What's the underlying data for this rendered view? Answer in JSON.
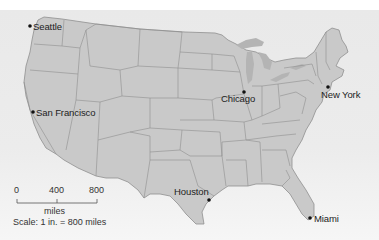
{
  "map": {
    "title": "United States",
    "land_color": "#c9c9c9",
    "border_color": "#8f8f8f",
    "background_color": "#ececec",
    "lake_color": "#b4b4b4"
  },
  "cities": [
    {
      "name": "Seattle",
      "x": 30,
      "y": 26
    },
    {
      "name": "San Francisco",
      "x": 33,
      "y": 112
    },
    {
      "name": "Chicago",
      "x": 244,
      "y": 92
    },
    {
      "name": "New York",
      "x": 328,
      "y": 88
    },
    {
      "name": "Houston",
      "x": 209,
      "y": 200
    },
    {
      "name": "Miami",
      "x": 310,
      "y": 218
    }
  ],
  "scale": {
    "ticks": [
      "0",
      "400",
      "800"
    ],
    "unit": "miles",
    "caption": "Scale: 1 in. = 800 miles"
  }
}
